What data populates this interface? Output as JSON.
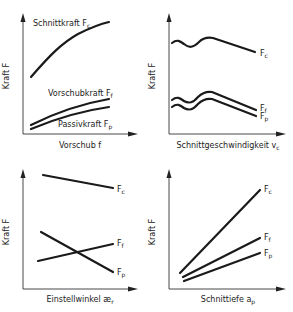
{
  "diagrams": [
    {
      "id": "feed",
      "ylabel": "Kraft F",
      "xlabel": "Vorschub f",
      "curves": [
        {
          "name": "Schnittkraft",
          "symbol": "F",
          "sub": "c",
          "label": "Schnittkraft F",
          "shape": "concave rising"
        },
        {
          "name": "Vorschubkraft",
          "symbol": "F",
          "sub": "f",
          "label": "Vorschubkraft F",
          "shape": "slightly concave rising"
        },
        {
          "name": "Passivkraft",
          "symbol": "F",
          "sub": "p",
          "label": "Passivkraft F",
          "shape": "slightly concave rising"
        }
      ]
    },
    {
      "id": "cutting-speed",
      "ylabel": "Kraft F",
      "xlabel": "Schnittgeschwindigkeit v",
      "xlabel_sub": "c",
      "curves": [
        {
          "symbol": "F",
          "sub": "c",
          "shape": "wavy then falling"
        },
        {
          "symbol": "F",
          "sub": "f",
          "shape": "wavy then falling"
        },
        {
          "symbol": "F",
          "sub": "p",
          "shape": "wavy then falling"
        }
      ]
    },
    {
      "id": "setting-angle",
      "ylabel": "Kraft F",
      "xlabel": "Einstellwinkel æ",
      "xlabel_sub": "r",
      "curves": [
        {
          "symbol": "F",
          "sub": "c",
          "shape": "linear falling slightly"
        },
        {
          "symbol": "F",
          "sub": "f",
          "shape": "linear rising"
        },
        {
          "symbol": "F",
          "sub": "p",
          "shape": "linear falling"
        }
      ]
    },
    {
      "id": "depth-of-cut",
      "ylabel": "Kraft F",
      "xlabel": "Schnittiefe a",
      "xlabel_sub": "p",
      "curves": [
        {
          "symbol": "F",
          "sub": "c",
          "shape": "linear rising steep"
        },
        {
          "symbol": "F",
          "sub": "f",
          "shape": "linear rising"
        },
        {
          "symbol": "F",
          "sub": "p",
          "shape": "linear rising"
        }
      ]
    }
  ]
}
